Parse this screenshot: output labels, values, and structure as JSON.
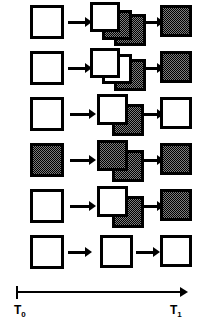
{
  "figure": {
    "colors": {
      "outline": "#000000",
      "empty_fill": "#ffffff",
      "filled_fill": "#7d7d7d"
    },
    "axis": {
      "start_label": "T",
      "start_subscript": "0",
      "end_label": "T",
      "end_subscript": "1",
      "direction": "left-to-right"
    },
    "rows": [
      {
        "id": "row-1",
        "left": {
          "state": "empty",
          "count": 1
        },
        "middle": {
          "states": [
            "empty",
            "filled",
            "filled"
          ],
          "count": 3
        },
        "right": {
          "state": "filled",
          "count": 1
        },
        "arrows": 2
      },
      {
        "id": "row-2",
        "left": {
          "state": "empty",
          "count": 1
        },
        "middle": {
          "states": [
            "empty",
            "empty",
            "filled"
          ],
          "count": 3
        },
        "right": {
          "state": "filled",
          "count": 1
        },
        "arrows": 2
      },
      {
        "id": "row-3",
        "left": {
          "state": "empty",
          "count": 1
        },
        "middle": {
          "states": [
            "empty",
            "filled"
          ],
          "count": 2
        },
        "right": {
          "state": "empty",
          "count": 1
        },
        "arrows": 2
      },
      {
        "id": "row-4",
        "left": {
          "state": "filled",
          "count": 1
        },
        "middle": {
          "states": [
            "filled",
            "filled"
          ],
          "count": 2
        },
        "right": {
          "state": "filled",
          "count": 1
        },
        "arrows": 2
      },
      {
        "id": "row-5",
        "left": {
          "state": "empty",
          "count": 1
        },
        "middle": {
          "states": [
            "empty",
            "filled"
          ],
          "count": 2
        },
        "right": {
          "state": "filled",
          "count": 1
        },
        "arrows": 2
      },
      {
        "id": "row-6",
        "left": {
          "state": "empty",
          "count": 1
        },
        "middle": {
          "states": [
            "empty"
          ],
          "count": 1
        },
        "right": {
          "state": "empty",
          "count": 1
        },
        "arrows": 2
      }
    ]
  }
}
